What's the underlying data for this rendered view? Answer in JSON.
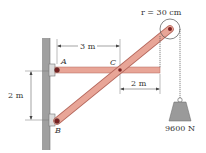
{
  "diagram": {
    "labels": {
      "point_a": "A",
      "point_b": "B",
      "point_c": "C",
      "dim_ac": "3 m",
      "dim_c_end": "2 m",
      "dim_ab": "2 m",
      "radius": "r = 30 cm",
      "weight": "9600 N"
    },
    "colors": {
      "beam": "#e8a597",
      "beam_edge": "#b5675c",
      "wall": "#9c9c9c",
      "weight": "#9a9a9a",
      "pin": "#7a1f1f"
    }
  }
}
